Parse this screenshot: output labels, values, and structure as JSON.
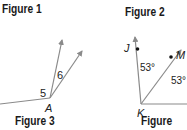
{
  "figures": [
    {
      "title": "Figure 1",
      "caption": "Figure 3",
      "vertex": "A",
      "angle_labels": [
        "5",
        "6"
      ]
    },
    {
      "title": "Figure 2",
      "caption": "Figure 4",
      "vertex": "K",
      "points": [
        "J",
        "M"
      ],
      "angle_labels": [
        "53°",
        "53°"
      ]
    }
  ],
  "colors": {
    "ray": "#8a8a8a",
    "text": "#222222"
  }
}
